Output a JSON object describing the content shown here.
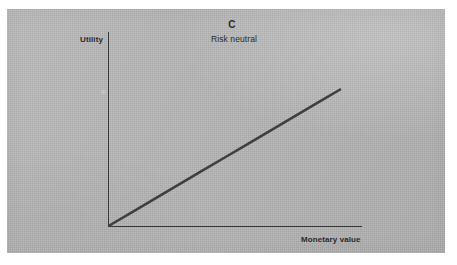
{
  "figure": {
    "panel_letter": "C",
    "subtitle": "Risk neutral",
    "background_color": "#b4b4b4",
    "ink_color": "#3f3f3f",
    "page_color": "#ffffff"
  },
  "chart_data": {
    "type": "line",
    "title": "C",
    "subtitle": "Risk neutral",
    "xlabel": "Monetary value",
    "ylabel": "Utility",
    "grid": false,
    "legend": null,
    "axis_tick_labels": {
      "x": [],
      "y": []
    },
    "xlim": [
      0,
      1
    ],
    "ylim": [
      0,
      1
    ],
    "series": [
      {
        "name": "Risk neutral utility function",
        "shape": "linear",
        "x": [
          0.0,
          0.1,
          0.2,
          0.3,
          0.4,
          0.5,
          0.6,
          0.7,
          0.8,
          0.9,
          1.0
        ],
        "values": [
          0.0,
          0.1,
          0.2,
          0.3,
          0.4,
          0.5,
          0.6,
          0.7,
          0.8,
          0.9,
          1.0
        ],
        "color": "#3f3f3f",
        "line_width": 2.6
      }
    ],
    "annotations": []
  }
}
